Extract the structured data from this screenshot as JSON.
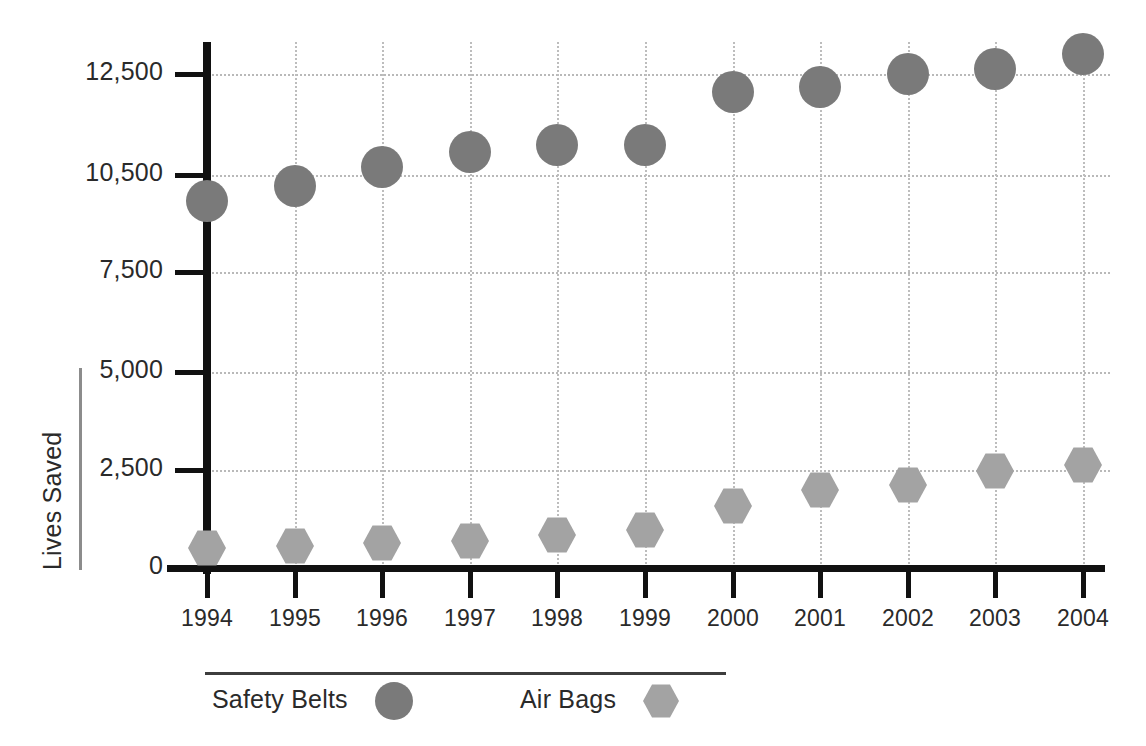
{
  "chart_data": {
    "type": "scatter",
    "title": "",
    "xlabel": "",
    "ylabel": "Lives Saved",
    "categories": [
      "1994",
      "1995",
      "1996",
      "1997",
      "1998",
      "1999",
      "2000",
      "2001",
      "2002",
      "2003",
      "2004"
    ],
    "ytick_labels": [
      "0",
      "2,500",
      "5,000",
      "7,500",
      "10,500",
      "12,500"
    ],
    "ytick_values": [
      0,
      2500,
      5000,
      7500,
      10500,
      12500
    ],
    "ylim": [
      0,
      13200
    ],
    "grid": "dotted-both",
    "legend_position": "bottom",
    "series": [
      {
        "name": "Safety Belts",
        "marker": "circle",
        "color": "#7a7a7a",
        "values": [
          9700,
          10150,
          10650,
          10950,
          11100,
          11100,
          12150,
          12250,
          12500,
          12600,
          12900
        ]
      },
      {
        "name": "Air Bags",
        "marker": "hexagon",
        "color": "#a3a3a3",
        "values": [
          500,
          560,
          650,
          680,
          830,
          980,
          1570,
          1980,
          2130,
          2470,
          2630
        ]
      }
    ]
  },
  "axis": {
    "y_title": "Lives Saved"
  },
  "legend": {
    "items": [
      {
        "label": "Safety Belts",
        "marker": "circle",
        "color": "#7a7a7a"
      },
      {
        "label": "Air Bags",
        "marker": "hexagon",
        "color": "#a3a3a3"
      }
    ]
  },
  "colors": {
    "safety_belts": "#7a7a7a",
    "air_bags": "#a3a3a3",
    "axis": "#111111",
    "grid": "#bdbdbd",
    "text": "#2a2a2a"
  }
}
